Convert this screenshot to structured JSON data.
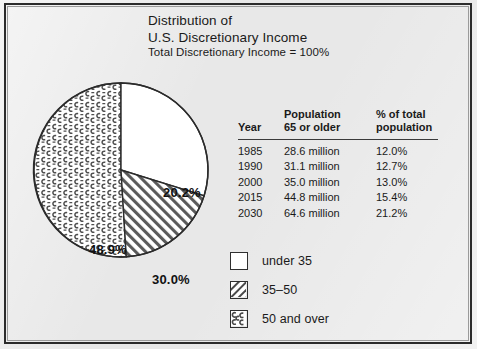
{
  "title": {
    "line1": "Distribution of",
    "line2": "U.S. Discretionary Income",
    "line3": "Total Discretionary Income  =  100%"
  },
  "chart_data": {
    "type": "pie",
    "title": "Distribution of U.S. Discretionary Income",
    "subtitle": "Total Discretionary Income = 100%",
    "categories": [
      "under 35",
      "35–50",
      "50 and over"
    ],
    "values": [
      20.2,
      30.0,
      48.9
    ],
    "labels": [
      "20.2%",
      "30.0%",
      "48.9%"
    ],
    "patterns": [
      "solid-white",
      "diagonal-hatch",
      "speckled"
    ],
    "legend_position": "bottom-right",
    "start_angle_deg": 0,
    "direction": "clockwise"
  },
  "table": {
    "columns": [
      {
        "header_line1": "Year",
        "header_line2": ""
      },
      {
        "header_line1": "Population",
        "header_line2": "65 or older"
      },
      {
        "header_line1": "% of total",
        "header_line2": "population"
      }
    ],
    "rows": [
      {
        "year": "1985",
        "population": "28.6 million",
        "percent": "12.0%"
      },
      {
        "year": "1990",
        "population": "31.1 million",
        "percent": "12.7%"
      },
      {
        "year": "2000",
        "population": "35.0 million",
        "percent": "13.0%"
      },
      {
        "year": "2015",
        "population": "44.8 million",
        "percent": "15.4%"
      },
      {
        "year": "2030",
        "population": "64.6 million",
        "percent": "21.2%"
      }
    ]
  },
  "legend": {
    "items": [
      {
        "label": "under 35",
        "pattern": "solid-white"
      },
      {
        "label": "35–50",
        "pattern": "diagonal-hatch"
      },
      {
        "label": "50 and over",
        "pattern": "speckled"
      }
    ]
  },
  "colors": {
    "page_background": "#e8e8e8",
    "frame": "#2b2b2b",
    "ink": "#1a1a1a",
    "slice_under35_fill": "#ffffff",
    "pattern_stroke": "#555555"
  }
}
